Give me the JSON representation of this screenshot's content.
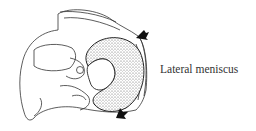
{
  "figure": {
    "highlighted_structure": "lateral-meniscus",
    "arrows": 2,
    "colors": {
      "line": "#222222",
      "stipple_fill": "#d8d8d8",
      "background": "#ffffff"
    }
  },
  "labels": {
    "lateral_meniscus": "Lateral meniscus"
  }
}
